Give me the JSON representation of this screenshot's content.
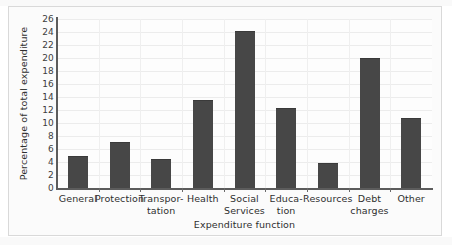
{
  "chart_data": {
    "type": "bar",
    "title": "",
    "xlabel": "Expenditure function",
    "ylabel": "Percentage of total expenditure",
    "categories": [
      "General",
      "Protection",
      "Transpor-\ntation",
      "Health",
      "Social\nServices",
      "Educa-\ntion",
      "Resources",
      "Debt\ncharges",
      "Other"
    ],
    "category_lines": [
      [
        "General",
        ""
      ],
      [
        "Protection",
        ""
      ],
      [
        "Transpor-",
        "tation"
      ],
      [
        "Health",
        ""
      ],
      [
        "Social",
        "Services"
      ],
      [
        "Educa-",
        "tion"
      ],
      [
        "Resources",
        ""
      ],
      [
        "Debt",
        "charges"
      ],
      [
        "Other",
        ""
      ]
    ],
    "values": [
      5.0,
      7.1,
      4.5,
      13.5,
      24.1,
      12.3,
      3.8,
      20.0,
      10.7
    ],
    "ylim": [
      0,
      26
    ],
    "ytick_step": 2,
    "yticks": [
      0,
      2,
      4,
      6,
      8,
      10,
      12,
      14,
      16,
      18,
      20,
      22,
      24,
      26
    ],
    "ytick_labels": [
      "0",
      "2",
      "4",
      "6",
      "8",
      "10",
      "12",
      "14",
      "16",
      "18",
      "20",
      "22",
      "24",
      "26"
    ],
    "grid": true,
    "legend": null,
    "bar_color": "#474747",
    "grid_color": "#ececec",
    "axis_color": "#5c5c5c",
    "background_color": "#fdfdfd",
    "frame_color": "#d9d9d9"
  }
}
